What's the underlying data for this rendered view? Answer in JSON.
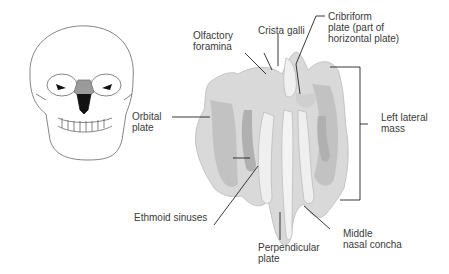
{
  "figure": {
    "labels": {
      "olfactory_foramina": [
        "Olfactory",
        "foramina"
      ],
      "crista_galli": [
        "Crista galli"
      ],
      "cribriform_plate": [
        "Cribriform",
        "plate (part of",
        "horizontal plate)"
      ],
      "left_lateral_mass": [
        "Left lateral",
        "mass"
      ],
      "orbital_plate": [
        "Orbital",
        "plate"
      ],
      "ethmoid_sinuses": [
        "Ethmoid sinuses"
      ],
      "perpendicular_plate": [
        "Perpendicular",
        "plate"
      ],
      "middle_nasal_concha": [
        "Middle",
        "nasal concha"
      ]
    },
    "colors": {
      "bone_fill": "#d9d9d9",
      "bone_shadow": "#b8b8b8",
      "leader_line": "#222222",
      "skull_highlight": "#9a9a9a"
    }
  }
}
